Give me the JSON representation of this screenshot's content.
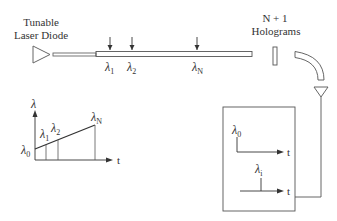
{
  "labels": {
    "laser_line1": "Tunable",
    "laser_line2": "Laser Diode",
    "holo_line1": "N + 1",
    "holo_line2": "Holograms",
    "fiber_l1": "λ",
    "fiber_l1_sub": "1",
    "fiber_l2": "λ",
    "fiber_l2_sub": "2",
    "fiber_lN": "λ",
    "fiber_lN_sub": "N"
  },
  "graph": {
    "y_axis_label": "λ",
    "x_axis_label": "t",
    "l0": "λ",
    "l0_sub": "0",
    "l1": "λ",
    "l1_sub": "1",
    "l2": "λ",
    "l2_sub": "2",
    "lN": "λ",
    "lN_sub": "N"
  },
  "detector_box": {
    "top_label": "λ",
    "top_label_sub": "0",
    "top_axis": "t",
    "bottom_label": "λ",
    "bottom_label_sub": "i",
    "bottom_axis": "t"
  },
  "colors": {
    "stroke": "#555555",
    "text": "#333333",
    "background": "#ffffff"
  }
}
